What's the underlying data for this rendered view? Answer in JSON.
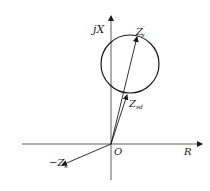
{
  "diagram": {
    "type": "impedance-plane-circle-diagram",
    "axes": {
      "vertical_label": "jX",
      "horizontal_label": "R",
      "origin_label": "O"
    },
    "labels": {
      "zs_prime": "Z",
      "zs_prime_sub": "s",
      "zs_prime_mark": "′",
      "zsd": "Z",
      "zsd_sub": "sd",
      "neg_zk": "−Z",
      "neg_zk_sub": "k"
    },
    "colors": {
      "line": "#1a1a1a",
      "axis": "#333333",
      "background": "#ffffff"
    }
  }
}
